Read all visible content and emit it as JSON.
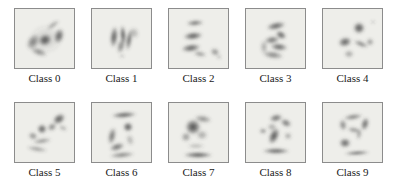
{
  "figure": {
    "type": "image-grid",
    "title": "",
    "rows": 2,
    "columns": 5,
    "background_color": "#ffffff",
    "cell_border_color": "#8c8c8c",
    "cell_background_color": "#eeeeea",
    "label_color": "#1a1a1a",
    "blob_color": "#3a3a3a"
  },
  "cells": [
    {
      "index": 0,
      "label": "Class 0",
      "row": 0,
      "column": 0,
      "description": "dark ring-like blob with bright center and crescent arc",
      "blobs": [
        {
          "cx": 30,
          "cy": 31,
          "rx": 7,
          "ry": 6,
          "rot": -25,
          "opacity": 0.88
        },
        {
          "cx": 44,
          "cy": 27,
          "rx": 5,
          "ry": 8,
          "rot": 15,
          "opacity": 0.8
        },
        {
          "cx": 18,
          "cy": 33,
          "rx": 6,
          "ry": 9,
          "rot": 30,
          "opacity": 0.62
        },
        {
          "cx": 24,
          "cy": 43,
          "rx": 9,
          "ry": 4,
          "rot": 20,
          "opacity": 0.55
        },
        {
          "cx": 38,
          "cy": 16,
          "rx": 8,
          "ry": 3,
          "rot": -35,
          "opacity": 0.42
        },
        {
          "cx": 31,
          "cy": 30,
          "rx": 17,
          "ry": 15,
          "rot": 0,
          "opacity": 0.16
        }
      ]
    },
    {
      "index": 1,
      "label": "Class 1",
      "row": 0,
      "column": 1,
      "description": "vertical dark strokes resembling the digit one",
      "blobs": [
        {
          "cx": 22,
          "cy": 28,
          "rx": 4,
          "ry": 11,
          "rot": 6,
          "opacity": 0.85
        },
        {
          "cx": 31,
          "cy": 26,
          "rx": 3,
          "ry": 10,
          "rot": -4,
          "opacity": 0.88
        },
        {
          "cx": 37,
          "cy": 31,
          "rx": 3,
          "ry": 11,
          "rot": 8,
          "opacity": 0.78
        },
        {
          "cx": 29,
          "cy": 37,
          "rx": 4,
          "ry": 8,
          "rot": 14,
          "opacity": 0.6
        },
        {
          "cx": 42,
          "cy": 24,
          "rx": 5,
          "ry": 6,
          "rot": -20,
          "opacity": 0.35
        },
        {
          "cx": 30,
          "cy": 47,
          "rx": 3,
          "ry": 2,
          "rot": 0,
          "opacity": 0.3
        }
      ]
    },
    {
      "index": 2,
      "label": "Class 2",
      "row": 0,
      "column": 2,
      "description": "three stacked horizontal dashes with small satellite blob",
      "blobs": [
        {
          "cx": 26,
          "cy": 14,
          "rx": 9,
          "ry": 3,
          "rot": -4,
          "opacity": 0.7
        },
        {
          "cx": 24,
          "cy": 27,
          "rx": 10,
          "ry": 4,
          "rot": -6,
          "opacity": 0.85
        },
        {
          "cx": 22,
          "cy": 39,
          "rx": 10,
          "ry": 4,
          "rot": -8,
          "opacity": 0.82
        },
        {
          "cx": 31,
          "cy": 45,
          "rx": 7,
          "ry": 3,
          "rot": 10,
          "opacity": 0.5
        },
        {
          "cx": 46,
          "cy": 43,
          "rx": 5,
          "ry": 4,
          "rot": 25,
          "opacity": 0.55
        },
        {
          "cx": 50,
          "cy": 48,
          "rx": 3,
          "ry": 2,
          "rot": 0,
          "opacity": 0.35
        }
      ]
    },
    {
      "index": 3,
      "label": "Class 3",
      "row": 0,
      "column": 3,
      "description": "curved strokes resembling the digit three",
      "blobs": [
        {
          "cx": 30,
          "cy": 17,
          "rx": 10,
          "ry": 4,
          "rot": -12,
          "opacity": 0.8
        },
        {
          "cx": 35,
          "cy": 26,
          "rx": 6,
          "ry": 4,
          "rot": 30,
          "opacity": 0.82
        },
        {
          "cx": 26,
          "cy": 31,
          "rx": 8,
          "ry": 4,
          "rot": -8,
          "opacity": 0.7
        },
        {
          "cx": 33,
          "cy": 38,
          "rx": 9,
          "ry": 4,
          "rot": 6,
          "opacity": 0.78
        },
        {
          "cx": 27,
          "cy": 46,
          "rx": 11,
          "ry": 4,
          "rot": 8,
          "opacity": 0.6
        },
        {
          "cx": 18,
          "cy": 38,
          "rx": 4,
          "ry": 7,
          "rot": 0,
          "opacity": 0.4
        }
      ]
    },
    {
      "index": 4,
      "label": "Class 4",
      "row": 0,
      "column": 4,
      "description": "scattered dark dots with diagonal streak",
      "blobs": [
        {
          "cx": 36,
          "cy": 19,
          "rx": 6,
          "ry": 6,
          "rot": 0,
          "opacity": 0.88
        },
        {
          "cx": 22,
          "cy": 33,
          "rx": 7,
          "ry": 5,
          "rot": -15,
          "opacity": 0.82
        },
        {
          "cx": 38,
          "cy": 35,
          "rx": 8,
          "ry": 3,
          "rot": 22,
          "opacity": 0.62
        },
        {
          "cx": 47,
          "cy": 33,
          "rx": 4,
          "ry": 4,
          "rot": 0,
          "opacity": 0.5
        },
        {
          "cx": 26,
          "cy": 45,
          "rx": 5,
          "ry": 4,
          "rot": 0,
          "opacity": 0.45
        },
        {
          "cx": 50,
          "cy": 13,
          "rx": 2,
          "ry": 2,
          "rot": 0,
          "opacity": 0.35
        }
      ]
    },
    {
      "index": 5,
      "label": "Class 5",
      "row": 1,
      "column": 0,
      "description": "diagonal chain of blobs rising to upper right with lower arc",
      "blobs": [
        {
          "cx": 44,
          "cy": 16,
          "rx": 7,
          "ry": 5,
          "rot": -35,
          "opacity": 0.85
        },
        {
          "cx": 37,
          "cy": 24,
          "rx": 5,
          "ry": 4,
          "rot": -30,
          "opacity": 0.6
        },
        {
          "cx": 27,
          "cy": 26,
          "rx": 5,
          "ry": 5,
          "rot": 0,
          "opacity": 0.82
        },
        {
          "cx": 18,
          "cy": 33,
          "rx": 5,
          "ry": 4,
          "rot": 20,
          "opacity": 0.55
        },
        {
          "cx": 27,
          "cy": 38,
          "rx": 10,
          "ry": 3,
          "rot": -8,
          "opacity": 0.5
        },
        {
          "cx": 22,
          "cy": 46,
          "rx": 11,
          "ry": 3,
          "rot": 10,
          "opacity": 0.45
        },
        {
          "cx": 48,
          "cy": 25,
          "rx": 5,
          "ry": 3,
          "rot": 30,
          "opacity": 0.35
        }
      ]
    },
    {
      "index": 6,
      "label": "Class 6",
      "row": 1,
      "column": 1,
      "description": "top bar, central dot and large lower crescent like digit six",
      "blobs": [
        {
          "cx": 32,
          "cy": 12,
          "rx": 13,
          "ry": 3,
          "rot": -4,
          "opacity": 0.85
        },
        {
          "cx": 36,
          "cy": 24,
          "rx": 5,
          "ry": 5,
          "rot": 0,
          "opacity": 0.88
        },
        {
          "cx": 20,
          "cy": 33,
          "rx": 4,
          "ry": 9,
          "rot": 12,
          "opacity": 0.7
        },
        {
          "cx": 25,
          "cy": 44,
          "rx": 8,
          "ry": 4,
          "rot": -18,
          "opacity": 0.72
        },
        {
          "cx": 30,
          "cy": 52,
          "rx": 13,
          "ry": 3,
          "rot": -5,
          "opacity": 0.62
        },
        {
          "cx": 38,
          "cy": 37,
          "rx": 4,
          "ry": 6,
          "rot": -20,
          "opacity": 0.35
        }
      ]
    },
    {
      "index": 7,
      "label": "Class 7",
      "row": 1,
      "column": 2,
      "description": "large dark nucleus upper left with heavy bottom bar",
      "blobs": [
        {
          "cx": 24,
          "cy": 24,
          "rx": 8,
          "ry": 8,
          "rot": 0,
          "opacity": 0.92
        },
        {
          "cx": 34,
          "cy": 16,
          "rx": 9,
          "ry": 4,
          "rot": 10,
          "opacity": 0.55
        },
        {
          "cx": 17,
          "cy": 34,
          "rx": 5,
          "ry": 5,
          "rot": 0,
          "opacity": 0.5
        },
        {
          "cx": 33,
          "cy": 32,
          "rx": 6,
          "ry": 5,
          "rot": 0,
          "opacity": 0.4
        },
        {
          "cx": 29,
          "cy": 52,
          "rx": 15,
          "ry": 3,
          "rot": 0,
          "opacity": 0.88
        },
        {
          "cx": 27,
          "cy": 43,
          "rx": 9,
          "ry": 3,
          "rot": 0,
          "opacity": 0.3
        }
      ]
    },
    {
      "index": 8,
      "label": "Class 8",
      "row": 1,
      "column": 3,
      "description": "upper loop with diagonal stroke and bottom bar like digit eight",
      "blobs": [
        {
          "cx": 30,
          "cy": 15,
          "rx": 7,
          "ry": 4,
          "rot": -12,
          "opacity": 0.72
        },
        {
          "cx": 40,
          "cy": 20,
          "rx": 6,
          "ry": 4,
          "rot": 25,
          "opacity": 0.7
        },
        {
          "cx": 26,
          "cy": 24,
          "rx": 5,
          "ry": 4,
          "rot": 0,
          "opacity": 0.4
        },
        {
          "cx": 28,
          "cy": 33,
          "rx": 5,
          "ry": 9,
          "rot": 25,
          "opacity": 0.88
        },
        {
          "cx": 17,
          "cy": 28,
          "rx": 4,
          "ry": 3,
          "rot": 0,
          "opacity": 0.55
        },
        {
          "cx": 42,
          "cy": 33,
          "rx": 4,
          "ry": 4,
          "rot": 0,
          "opacity": 0.4
        },
        {
          "cx": 30,
          "cy": 48,
          "rx": 14,
          "ry": 3,
          "rot": 0,
          "opacity": 0.82
        }
      ]
    },
    {
      "index": 9,
      "label": "Class 9",
      "row": 1,
      "column": 4,
      "description": "upper loop with tail and isolated lower dot and bottom dash",
      "blobs": [
        {
          "cx": 30,
          "cy": 14,
          "rx": 10,
          "ry": 3,
          "rot": -8,
          "opacity": 0.65
        },
        {
          "cx": 42,
          "cy": 21,
          "rx": 4,
          "ry": 7,
          "rot": 15,
          "opacity": 0.78
        },
        {
          "cx": 20,
          "cy": 22,
          "rx": 4,
          "ry": 6,
          "rot": -10,
          "opacity": 0.6
        },
        {
          "cx": 31,
          "cy": 27,
          "rx": 7,
          "ry": 3,
          "rot": 10,
          "opacity": 0.55
        },
        {
          "cx": 36,
          "cy": 31,
          "rx": 3,
          "ry": 6,
          "rot": 10,
          "opacity": 0.45
        },
        {
          "cx": 22,
          "cy": 40,
          "rx": 6,
          "ry": 5,
          "rot": 0,
          "opacity": 0.8
        },
        {
          "cx": 34,
          "cy": 50,
          "rx": 13,
          "ry": 2,
          "rot": -3,
          "opacity": 0.85
        }
      ]
    }
  ]
}
